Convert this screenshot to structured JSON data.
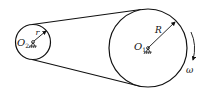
{
  "diagram": {
    "type": "belt-drive",
    "small_pulley": {
      "center_label": "O",
      "center_subscript": "2",
      "radius_label": "r"
    },
    "large_pulley": {
      "center_label": "O",
      "center_subscript": "1",
      "radius_label": "R"
    },
    "rotation_label": "ω",
    "colors": {
      "stroke": "#111111",
      "background": "#ffffff"
    }
  }
}
